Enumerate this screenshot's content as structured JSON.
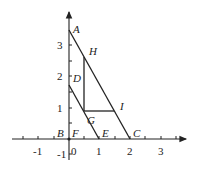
{
  "diagram": {
    "type": "coordinate-geometry",
    "axes": {
      "x_ticks": [
        {
          "value": -1,
          "label": "-1"
        },
        {
          "value": 1,
          "label": "1"
        },
        {
          "value": 2,
          "label": "2"
        },
        {
          "value": 3,
          "label": "3"
        }
      ],
      "y_ticks": [
        {
          "value": 1,
          "label": "1"
        },
        {
          "value": 2,
          "label": "2"
        },
        {
          "value": 3,
          "label": "3"
        },
        {
          "value": -1,
          "label": "-1"
        }
      ],
      "origin_label": "0"
    },
    "points": {
      "A": {
        "label": "A",
        "x": 0,
        "y": 3.5
      },
      "B": {
        "label": "B",
        "x": 0,
        "y": 0
      },
      "C": {
        "label": "C",
        "x": 2,
        "y": 0
      },
      "D": {
        "label": "D",
        "x": 0,
        "y": 1.75
      },
      "E": {
        "label": "E",
        "x": 1,
        "y": 0
      },
      "F": {
        "label": "F",
        "x": 0,
        "y": 0
      },
      "G": {
        "label": "G",
        "x": 0.5,
        "y": 0.9
      },
      "H": {
        "label": "H",
        "x": 0.5,
        "y": 2.625
      },
      "I": {
        "label": "I",
        "x": 1.45,
        "y": 0.9
      }
    },
    "segments": [
      "AC",
      "DE",
      "HG",
      "GI"
    ]
  }
}
